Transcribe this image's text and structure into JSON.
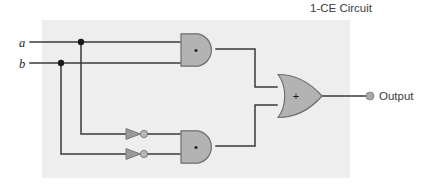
{
  "figure": {
    "title": "1-CE Circuit",
    "panel": {
      "x": 42,
      "y": 20,
      "width": 308,
      "height": 158,
      "fill": "#eeeeee"
    }
  },
  "colors": {
    "background": "#ffffff",
    "panel": "#eeeeee",
    "wire": "#3a3a3a",
    "gate_fill": "#b3b3b3",
    "gate_stroke": "#6e6e6e",
    "inverter_fill": "#9a9a9a",
    "bubble_fill": "#b8b8b8",
    "terminal_fill": "#a8a8a8",
    "text": "#3b3b3b",
    "junction": "#1a1a1a"
  },
  "inputs": [
    {
      "name": "input-a",
      "label": "a",
      "label_x": 22,
      "label_y": 47,
      "wire_y": 42,
      "junction_x": 81
    },
    {
      "name": "input-b",
      "label": "b",
      "label_x": 22,
      "label_y": 68,
      "wire_y": 63,
      "junction_x": 61
    }
  ],
  "gates": [
    {
      "name": "and-gate-top",
      "type": "AND",
      "symbol": "•",
      "x": 180,
      "y": 33,
      "width": 36,
      "height": 33,
      "symbol_x": 196,
      "symbol_y": 53
    },
    {
      "name": "and-gate-bottom",
      "type": "AND",
      "symbol": "•",
      "x": 180,
      "y": 130,
      "width": 36,
      "height": 33,
      "symbol_x": 196,
      "symbol_y": 150
    },
    {
      "name": "or-gate",
      "type": "OR",
      "symbol": "+",
      "x": 277,
      "y": 74,
      "width": 45,
      "height": 44,
      "symbol_x": 296,
      "symbol_y": 100
    }
  ],
  "inverters": [
    {
      "name": "inverter-a",
      "x": 126,
      "y": 134,
      "width": 14,
      "height": 12,
      "bubble_x": 144,
      "bubble_r": 3.6
    },
    {
      "name": "inverter-b",
      "x": 126,
      "y": 154,
      "width": 14,
      "height": 12,
      "bubble_x": 144,
      "bubble_r": 3.6
    }
  ],
  "output": {
    "name": "output-terminal",
    "label": "Output",
    "terminal_x": 370,
    "terminal_y": 92,
    "terminal_r": 4,
    "label_x": 379,
    "label_y": 96
  },
  "wires": [
    {
      "name": "wire-a-to-and-top",
      "points": "30,42 180,42"
    },
    {
      "name": "wire-b-to-and-top",
      "points": "30,63 180,63"
    },
    {
      "name": "wire-a-branch-down",
      "points": "81,42 81,134 126,134"
    },
    {
      "name": "wire-b-branch-down",
      "points": "61,63 61,154 126,154"
    },
    {
      "name": "wire-inv-a-to-and-bottom",
      "points": "148,134 180,134"
    },
    {
      "name": "wire-inv-b-to-and-bottom",
      "points": "148,154 180,154"
    },
    {
      "name": "wire-and-top-to-or",
      "points": "216,49 255,49 255,87 277,87"
    },
    {
      "name": "wire-and-bottom-to-or",
      "points": "216,146 255,146 255,105 277,105"
    },
    {
      "name": "wire-or-to-output",
      "points": "322,96 370,96"
    }
  ],
  "junctions": [
    {
      "name": "junction-a",
      "x": 81,
      "y": 42,
      "r": 3.2
    },
    {
      "name": "junction-b",
      "x": 61,
      "y": 63,
      "r": 3.2
    }
  ]
}
